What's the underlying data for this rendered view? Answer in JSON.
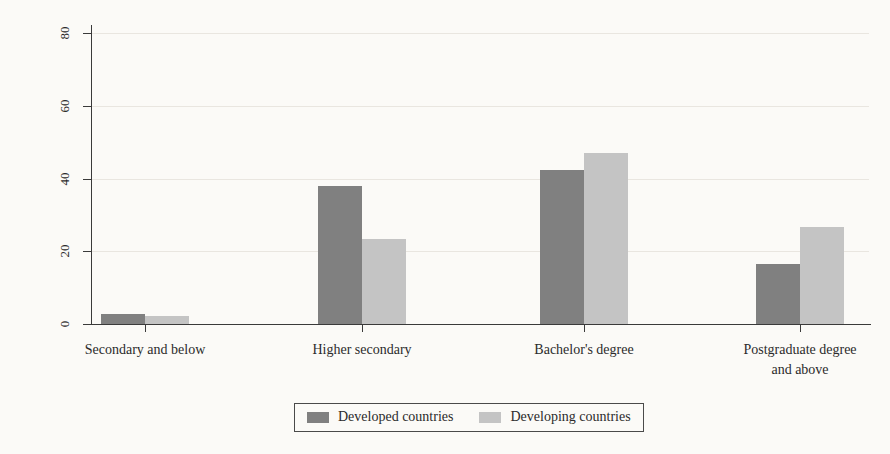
{
  "chart_data": {
    "type": "bar",
    "title": "",
    "xlabel": "",
    "ylabel": "Percentage of respondents",
    "ylim": [
      0,
      80
    ],
    "yticks": [
      0,
      20,
      40,
      60,
      80
    ],
    "grid": true,
    "legend_position": "bottom",
    "categories": [
      "Secondary and below",
      "Higher secondary",
      "Bachelor's degree",
      "Postgraduate degree\nand above"
    ],
    "series": [
      {
        "name": "Developed countries",
        "color": "#808080",
        "values": [
          2.8,
          38.0,
          42.3,
          16.5
        ]
      },
      {
        "name": "Developing countries",
        "color": "#c4c4c4",
        "values": [
          2.2,
          23.4,
          47.0,
          26.8
        ]
      }
    ]
  },
  "axis": {
    "y_title": "Percentage of respondents",
    "y_tick_labels": [
      "0",
      "20",
      "40",
      "60",
      "80"
    ]
  },
  "legend": {
    "items": [
      {
        "label": "Developed countries",
        "swatch": "developed"
      },
      {
        "label": "Developing countries",
        "swatch": "developing"
      }
    ]
  },
  "colors": {
    "developed": "#808080",
    "developing": "#c4c4c4",
    "axis": "#3a3a3a",
    "grid": "#e9e6e0",
    "background": "#fbfaf7"
  }
}
